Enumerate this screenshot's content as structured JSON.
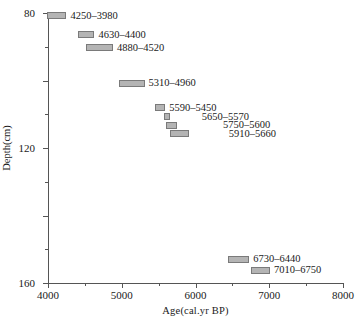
{
  "chart_data": {
    "type": "bar",
    "title": "",
    "xlabel": "Age(cal.yr  BP)",
    "ylabel": "Depth(cm)",
    "xlim": [
      4000,
      8000
    ],
    "ylim": [
      240,
      80
    ],
    "y_inverted": true,
    "grid": false,
    "legend": null,
    "x_ticks": [
      4000,
      5000,
      6000,
      7000,
      8000
    ],
    "x_tick_labels": [
      "4000",
      "5000",
      "6000",
      "7000",
      "8000"
    ],
    "x_minor_ticks": [
      4500,
      5500,
      6500,
      7500
    ],
    "y_ticks": [
      80,
      120,
      160,
      200,
      240
    ],
    "y_tick_labels": [
      "80",
      "120",
      "160",
      "200",
      "240"
    ],
    "y_minor_ticks": [
      100,
      140,
      180,
      220
    ],
    "orientation": "horizontal-range-bars",
    "bars": [
      {
        "label": "4250–3980",
        "age_min": 3980,
        "age_max": 4250,
        "depth": 81.5,
        "label_dx": 4
      },
      {
        "label": "4630–4400",
        "age_min": 4400,
        "age_max": 4630,
        "depth": 93.0,
        "label_dx": 4
      },
      {
        "label": "4880–4520",
        "age_min": 4520,
        "age_max": 4880,
        "depth": 100.5,
        "label_dx": 4
      },
      {
        "label": "5310–4960",
        "age_min": 4960,
        "age_max": 5310,
        "depth": 121.5,
        "label_dx": 4
      },
      {
        "label": "5590–5450",
        "age_min": 5450,
        "age_max": 5590,
        "depth": 136.0,
        "label_dx": 4
      },
      {
        "label": "5650–5570",
        "age_min": 5570,
        "age_max": 5650,
        "depth": 141.5,
        "label_dx": 32
      },
      {
        "label": "5750–5600",
        "age_min": 5600,
        "age_max": 5750,
        "depth": 146.5,
        "label_dx": 46
      },
      {
        "label": "5910–5660",
        "age_min": 5660,
        "age_max": 5910,
        "depth": 151.5,
        "label_dx": 40
      },
      {
        "label": "6730–6440",
        "age_min": 6440,
        "age_max": 6730,
        "depth": 226.0,
        "label_dx": 4
      },
      {
        "label": "7010–6750",
        "age_min": 6750,
        "age_max": 7010,
        "depth": 232.5,
        "label_dx": 4
      }
    ]
  }
}
